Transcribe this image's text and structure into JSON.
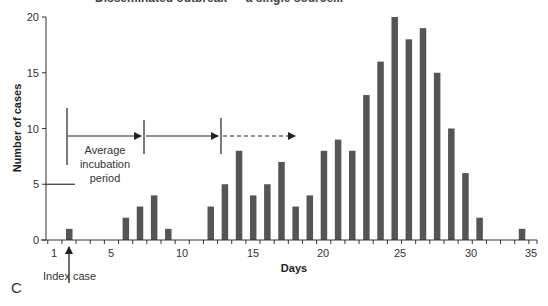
{
  "title_partial": "Disseminated outbreak — a single source...",
  "panel_label": "C",
  "annotations": {
    "incubation_label": [
      "Average",
      "incubation",
      "period"
    ],
    "index_case_label": "Index case"
  },
  "colors": {
    "bar": "#555555",
    "axis": "#333333"
  },
  "chart_data": {
    "type": "bar",
    "title": "",
    "xlabel": "Days",
    "ylabel": "Number of cases",
    "xlim": [
      0.5,
      35
    ],
    "ylim": [
      0,
      20
    ],
    "x_ticks": [
      1,
      5,
      10,
      15,
      20,
      25,
      30,
      35
    ],
    "y_ticks": [
      0,
      5,
      10,
      15,
      20
    ],
    "grid": false,
    "legend": null,
    "categories": [
      2,
      6,
      7,
      8,
      9,
      12,
      13,
      14,
      15,
      16,
      17,
      18,
      19,
      20,
      21,
      22,
      23,
      24,
      25,
      26,
      27,
      28,
      29,
      30,
      31,
      34
    ],
    "values": [
      1,
      2,
      3,
      4,
      1,
      3,
      5,
      8,
      4,
      5,
      7,
      3,
      4,
      8,
      9,
      8,
      13,
      16,
      20,
      18,
      19,
      15,
      10,
      6,
      2,
      1
    ],
    "annotations": [
      {
        "text": "Index case",
        "x": 2,
        "type": "arrow-up"
      },
      {
        "text": "Average incubation period",
        "type": "interval-arrows",
        "segments": [
          [
            2,
            7
          ],
          [
            7,
            12.5
          ],
          [
            12.5,
            18
          ]
        ],
        "last_dashed": true
      }
    ]
  }
}
